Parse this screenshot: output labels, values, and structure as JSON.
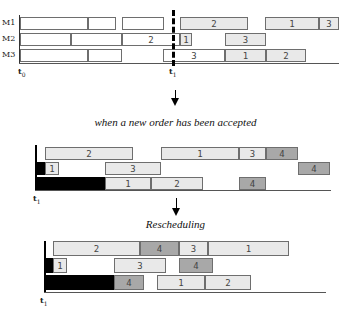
{
  "top_section": {
    "machines": [
      "M1",
      "M2",
      "M3"
    ],
    "t0_label": "t",
    "t0_sub": "0",
    "t1_label": "t",
    "t1_sub": "1",
    "rows": [
      [
        {
          "x": 20,
          "w": 68,
          "label": "",
          "style": "empty"
        },
        {
          "x": 88,
          "w": 28,
          "label": "",
          "style": "empty"
        },
        {
          "x": 122,
          "w": 42,
          "label": "",
          "style": "empty"
        },
        {
          "x": 180,
          "w": 68,
          "label": "2",
          "style": "light"
        },
        {
          "x": 265,
          "w": 54,
          "label": "1",
          "style": "light"
        },
        {
          "x": 319,
          "w": 20,
          "label": "3",
          "style": "light"
        }
      ],
      [
        {
          "x": 20,
          "w": 51,
          "label": "",
          "style": "empty"
        },
        {
          "x": 71,
          "w": 51,
          "label": "",
          "style": "empty"
        },
        {
          "x": 122,
          "w": 58,
          "label": "2",
          "style": "empty"
        },
        {
          "x": 180,
          "w": 12,
          "label": "1",
          "style": "light"
        },
        {
          "x": 225,
          "w": 41,
          "label": "3",
          "style": "light"
        }
      ],
      [
        {
          "x": 20,
          "w": 68,
          "label": "",
          "style": "empty"
        },
        {
          "x": 88,
          "w": 34,
          "label": "",
          "style": "empty"
        },
        {
          "x": 163,
          "w": 62,
          "label": "3",
          "style": "empty"
        },
        {
          "x": 225,
          "w": 41,
          "label": "1",
          "style": "light"
        },
        {
          "x": 266,
          "w": 40,
          "label": "2",
          "style": "light"
        }
      ]
    ]
  },
  "caption_1": "when a new order has been accepted",
  "middle_section": {
    "t1_label": "t",
    "t1_sub": "1",
    "rows": [
      [
        {
          "x": 45,
          "w": 88,
          "label": "2",
          "style": "light"
        },
        {
          "x": 161,
          "w": 78,
          "label": "1",
          "style": "light"
        },
        {
          "x": 239,
          "w": 27,
          "label": "3",
          "style": "light"
        },
        {
          "x": 266,
          "w": 32,
          "label": "4",
          "style": "dark"
        }
      ],
      [
        {
          "x": 35,
          "w": 10,
          "label": "",
          "style": "black"
        },
        {
          "x": 45,
          "w": 14,
          "label": "1",
          "style": "light"
        },
        {
          "x": 105,
          "w": 56,
          "label": "3",
          "style": "light"
        },
        {
          "x": 298,
          "w": 32,
          "label": "4",
          "style": "dark"
        }
      ],
      [
        {
          "x": 35,
          "w": 70,
          "label": "",
          "style": "black"
        },
        {
          "x": 105,
          "w": 46,
          "label": "1",
          "style": "light"
        },
        {
          "x": 151,
          "w": 52,
          "label": "2",
          "style": "light"
        },
        {
          "x": 239,
          "w": 27,
          "label": "4",
          "style": "dark"
        }
      ]
    ]
  },
  "caption_2": "Rescheduling",
  "bottom_section": {
    "t1_label": "t",
    "t1_sub": "1",
    "rows": [
      [
        {
          "x": 53,
          "w": 87,
          "label": "2",
          "style": "light"
        },
        {
          "x": 140,
          "w": 39,
          "label": "4",
          "style": "dark"
        },
        {
          "x": 179,
          "w": 29,
          "label": "3",
          "style": "light"
        },
        {
          "x": 208,
          "w": 81,
          "label": "1",
          "style": "light"
        }
      ],
      [
        {
          "x": 45,
          "w": 8,
          "label": "",
          "style": "black"
        },
        {
          "x": 53,
          "w": 14,
          "label": "1",
          "style": "light"
        },
        {
          "x": 114,
          "w": 52,
          "label": "3",
          "style": "light"
        },
        {
          "x": 179,
          "w": 34,
          "label": "4",
          "style": "dark"
        }
      ],
      [
        {
          "x": 45,
          "w": 69,
          "label": "",
          "style": "black"
        },
        {
          "x": 114,
          "w": 30,
          "label": "4",
          "style": "dark"
        },
        {
          "x": 157,
          "w": 48,
          "label": "1",
          "style": "light"
        },
        {
          "x": 205,
          "w": 46,
          "label": "2",
          "style": "light"
        }
      ]
    ]
  }
}
